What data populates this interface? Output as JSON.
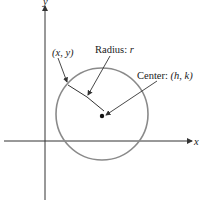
{
  "diagram": {
    "type": "circle-equation-diagram",
    "axes": {
      "x_label": "x",
      "y_label": "y"
    },
    "labels": {
      "point": "(x, y)",
      "radius_prefix": "Radius: ",
      "radius_var": "r",
      "center_prefix": "Center: ",
      "center_value": "(h, k)"
    },
    "colors": {
      "circle": "#8a8a8a",
      "axes": "#333333",
      "text": "#222222"
    }
  }
}
